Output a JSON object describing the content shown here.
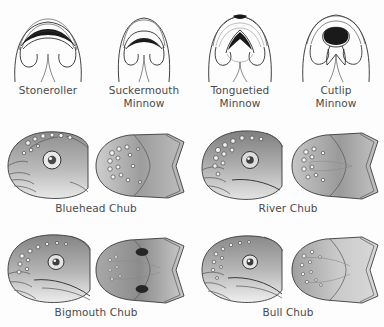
{
  "figure": {
    "background_color": "#fdfdfd",
    "label_color": "#4a4a4a",
    "ink_color": "#2b2b2b"
  },
  "mouth_diagrams": {
    "view": "ventral mouth view",
    "items": [
      {
        "label_line1": "Stoneroller",
        "label_line2": "",
        "name": "stoneroller"
      },
      {
        "label_line1": "Suckermouth",
        "label_line2": "Minnow",
        "name": "suckermouth-minnow"
      },
      {
        "label_line1": "Tonguetied",
        "label_line2": "Minnow",
        "name": "tonguetied-minnow"
      },
      {
        "label_line1": "Cutlip",
        "label_line2": "Minnow",
        "name": "cutlip-minnow"
      }
    ]
  },
  "chub_panels": {
    "views": [
      "lateral head",
      "dorsal head"
    ],
    "items": [
      {
        "label": "Bluehead Chub",
        "name": "bluehead-chub"
      },
      {
        "label": "River Chub",
        "name": "river-chub"
      },
      {
        "label": "Bigmouth Chub",
        "name": "bigmouth-chub"
      },
      {
        "label": "Bull Chub",
        "name": "bull-chub"
      }
    ]
  }
}
